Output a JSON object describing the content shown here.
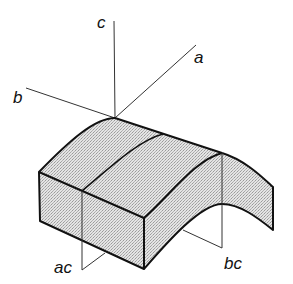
{
  "diagram": {
    "axes": [
      {
        "name": "a",
        "label": "a"
      },
      {
        "name": "b",
        "label": "b"
      },
      {
        "name": "c",
        "label": "c"
      }
    ],
    "sections": [
      {
        "name": "ac",
        "label": "ac"
      },
      {
        "name": "bc",
        "label": "bc"
      }
    ],
    "colors": {
      "stroke": "#111111",
      "fill": "#d9d9d9",
      "thin": "#333333"
    }
  }
}
